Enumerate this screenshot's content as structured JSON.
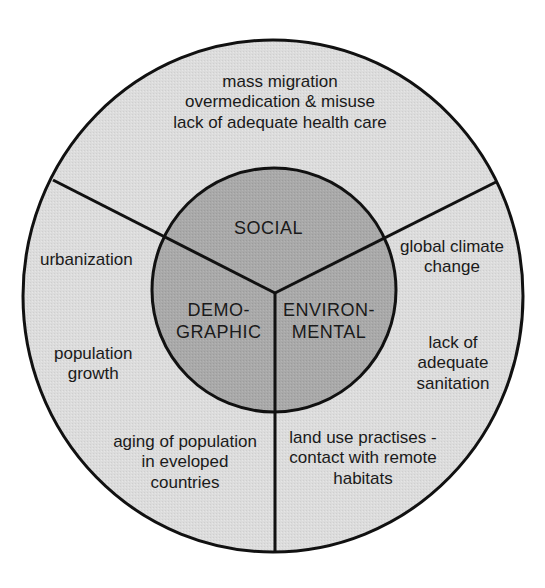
{
  "diagram": {
    "colors": {
      "background": "#ffffff",
      "outer_fill": "#dcdcdc",
      "inner_fill": "#a9a9a9",
      "stroke": "#111111"
    },
    "inner": {
      "social": "SOCIAL",
      "demographic": [
        "DEMO-",
        "GRAPHIC"
      ],
      "environmental": [
        "ENVIRON-",
        "MENTAL"
      ]
    },
    "outer": {
      "social": [
        "mass migration",
        "overmedication & misuse",
        "lack of adequate health care"
      ],
      "demographic_top": [
        "urbanization"
      ],
      "demographic_mid": [
        "population",
        "growth"
      ],
      "demographic_bottom": [
        "aging of population",
        "in eveloped",
        "countries"
      ],
      "environmental_top": [
        "global climate",
        "change"
      ],
      "environmental_mid": [
        "lack of",
        "adequate",
        "sanitation"
      ],
      "environmental_bottom": [
        "land use practises -",
        "contact with remote",
        "habitats"
      ]
    }
  }
}
